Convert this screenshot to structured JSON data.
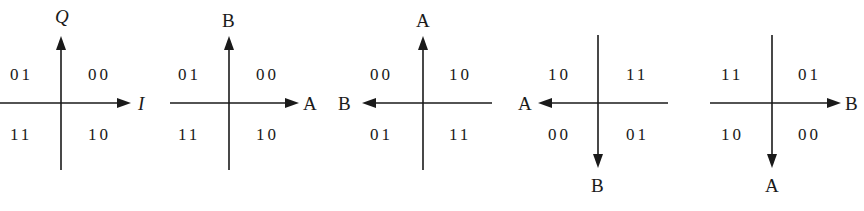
{
  "diagrams": [
    {
      "id": "qpsk-iq",
      "x_axis_label": "I",
      "y_axis_label": "Q",
      "x_direction": "right",
      "y_direction": "up",
      "quadrants": {
        "top_left": "01",
        "top_right": "00",
        "bottom_left": "11",
        "bottom_right": "10"
      }
    },
    {
      "id": "ab-1",
      "x_axis_label": "A",
      "y_axis_label": "B",
      "x_direction": "right",
      "y_direction": "up",
      "quadrants": {
        "top_left": "01",
        "top_right": "00",
        "bottom_left": "11",
        "bottom_right": "10"
      }
    },
    {
      "id": "ab-2",
      "x_axis_label": "B",
      "y_axis_label": "A",
      "x_direction": "left",
      "y_direction": "up",
      "quadrants": {
        "top_left": "00",
        "top_right": "10",
        "bottom_left": "01",
        "bottom_right": "11"
      }
    },
    {
      "id": "ab-3",
      "x_axis_label": "A",
      "y_axis_label": "B",
      "x_direction": "left",
      "y_direction": "down",
      "quadrants": {
        "top_left": "10",
        "top_right": "11",
        "bottom_left": "00",
        "bottom_right": "01"
      }
    },
    {
      "id": "ab-4",
      "x_axis_label": "B",
      "y_axis_label": "A",
      "x_direction": "right",
      "y_direction": "down",
      "quadrants": {
        "top_left": "11",
        "top_right": "01",
        "bottom_left": "10",
        "bottom_right": "00"
      }
    }
  ]
}
